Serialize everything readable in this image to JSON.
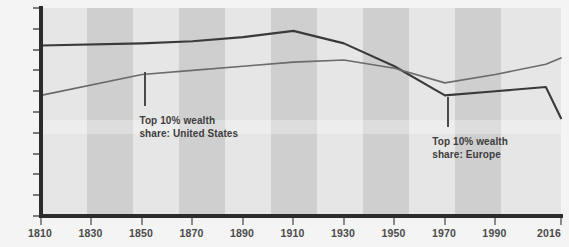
{
  "chart_data": {
    "type": "line",
    "title": "",
    "subtitle": "",
    "xlabel": "",
    "ylabel": "",
    "xlim": [
      1810,
      2016
    ],
    "ylim": [
      0,
      100
    ],
    "grid": false,
    "legend_position": "inline-annotations",
    "y_ticks": [
      "0",
      "10",
      "20",
      "30",
      "40",
      "50",
      "60",
      "70",
      "80",
      "90",
      "100%"
    ],
    "y_tick_values": [
      0,
      10,
      20,
      30,
      40,
      50,
      60,
      70,
      80,
      90,
      100
    ],
    "x_ticks": [
      "1810",
      "1830",
      "1850",
      "1870",
      "1890",
      "1910",
      "1930",
      "1950",
      "1970",
      "1990",
      "2016"
    ],
    "x_tick_values": [
      1810,
      1830,
      1850,
      1870,
      1890,
      1910,
      1930,
      1950,
      1970,
      1990,
      2016
    ],
    "series": [
      {
        "name": "Top 10% wealth share: Europe",
        "color": "#3a3a3a",
        "x": [
          1810,
          1850,
          1870,
          1890,
          1910,
          1930,
          1950,
          1970,
          1990,
          2010,
          2016
        ],
        "values": [
          82,
          83,
          84,
          86,
          89,
          83,
          72,
          58,
          60,
          62,
          47
        ]
      },
      {
        "name": "Top 10% wealth share: United States",
        "color": "#6b6b6b",
        "x": [
          1810,
          1850,
          1870,
          1890,
          1910,
          1930,
          1950,
          1970,
          1990,
          2010,
          2016
        ],
        "values": [
          58,
          68,
          70,
          72,
          74,
          75,
          71,
          64,
          68,
          73,
          76
        ]
      }
    ],
    "annotations": [
      {
        "id": "annot-united-states",
        "text": "Top 10% wealth\nshare: United States",
        "label_x": 1849,
        "label_y": 49,
        "leader_x": 1851,
        "leader_from_y": 53,
        "leader_to_y": 69
      },
      {
        "id": "annot-europe",
        "text": "Top 10% wealth\nshare: Europe",
        "label_x": 1965,
        "label_y": 39,
        "leader_x": 1971,
        "leader_from_y": 43,
        "leader_to_y": 57
      }
    ],
    "background_bands": {
      "description": "alternating vertical gray stripes, one per 20-year interval",
      "light": "#e6e6e6",
      "dark": "#cfcfcf",
      "count": 11
    }
  }
}
